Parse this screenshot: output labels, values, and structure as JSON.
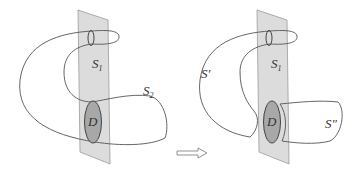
{
  "colors": {
    "plane_fill": "#d9d9d9",
    "plane_stroke": "#9a9a9a",
    "curve_stroke": "#555555",
    "disk_fill": "#a8a8a8",
    "background": "#ffffff"
  },
  "left_panel": {
    "labels": {
      "s1": {
        "base": "S",
        "sub": "1"
      },
      "s2": {
        "base": "S",
        "sub": "2"
      },
      "disk": "D"
    }
  },
  "right_panel": {
    "labels": {
      "s_prime": "S′",
      "s1": {
        "base": "S",
        "sub": "1"
      },
      "s_double_prime": "S″",
      "disk": "D"
    }
  },
  "arrow": {
    "direction": "right"
  }
}
